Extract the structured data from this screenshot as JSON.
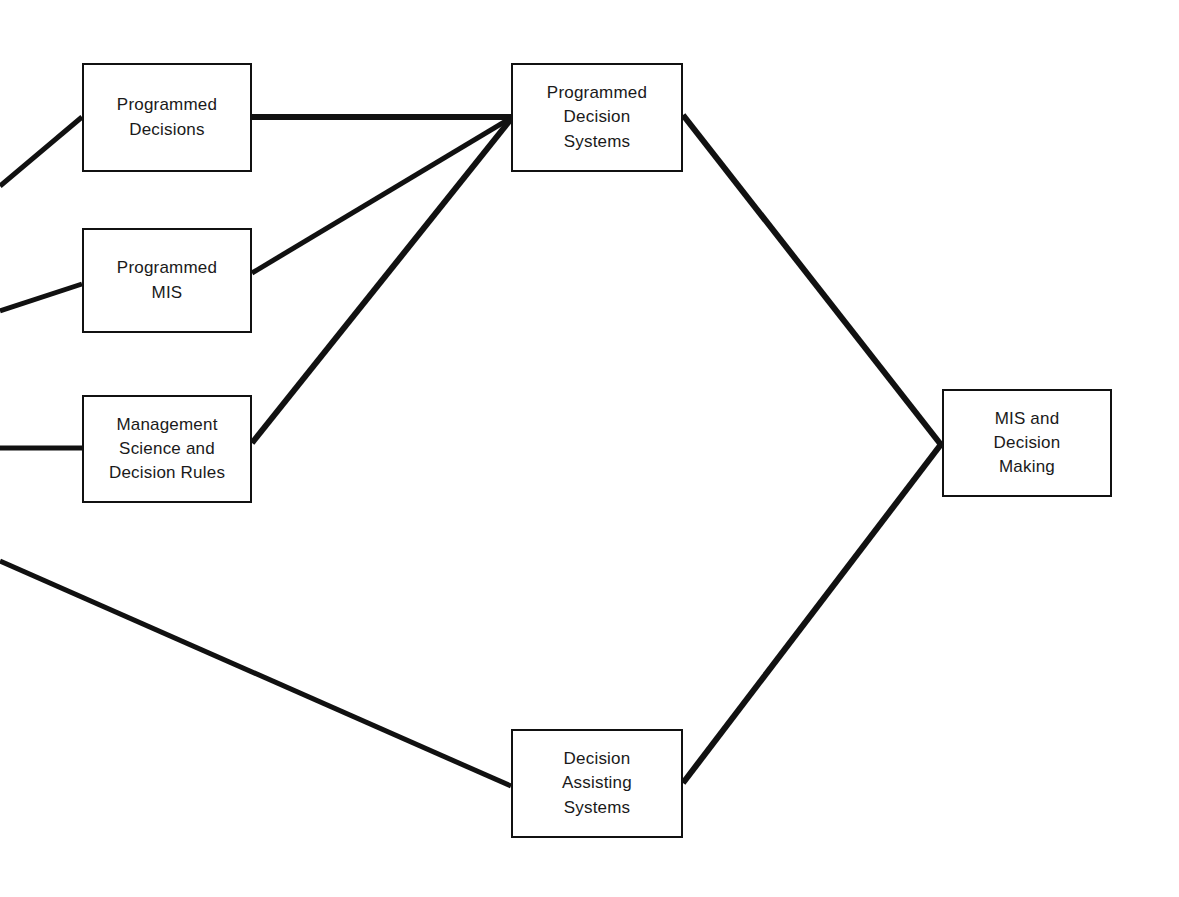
{
  "diagram": {
    "title": "MIS and Decision Making",
    "type": "flow-diagram",
    "canvas": {
      "width": 1179,
      "height": 897
    },
    "colors": {
      "background": "#ffffff",
      "box_border": "#111111",
      "connector": "#111111",
      "text": "#1a1a1a"
    },
    "nodes": [
      {
        "id": "programmed-decisions",
        "label": "Programmed\nDecisions",
        "x": 82,
        "y": 63,
        "width": 170,
        "height": 109
      },
      {
        "id": "programmed-mis",
        "label": "Programmed\nMIS",
        "x": 82,
        "y": 228,
        "width": 170,
        "height": 105
      },
      {
        "id": "management-science-and-decision-rules",
        "label": "Management\nScience and\nDecision Rules",
        "x": 82,
        "y": 395,
        "width": 170,
        "height": 108
      },
      {
        "id": "programmed-decision-systems",
        "label": "Programmed\nDecision\nSystems",
        "x": 511,
        "y": 63,
        "width": 172,
        "height": 109
      },
      {
        "id": "decision-assisting-systems",
        "label": "Decision\nAssisting\nSystems",
        "x": 511,
        "y": 729,
        "width": 172,
        "height": 109
      },
      {
        "id": "mis-and-decision-making",
        "label": "MIS and\nDecision\nMaking",
        "x": 942,
        "y": 389,
        "width": 170,
        "height": 108
      }
    ],
    "connectors": [
      {
        "id": "offscreen-to-programmed-decisions",
        "from": "left-edge",
        "to": "programmed-decisions",
        "x1": 0,
        "y1": 186,
        "x2": 82,
        "y2": 117,
        "width": 5
      },
      {
        "id": "offscreen-to-programmed-mis",
        "from": "left-edge",
        "to": "programmed-mis",
        "x1": 0,
        "y1": 311,
        "x2": 82,
        "y2": 284,
        "width": 5
      },
      {
        "id": "offscreen-to-management-science",
        "from": "left-edge",
        "to": "management-science-and-decision-rules",
        "x1": 0,
        "y1": 448,
        "x2": 82,
        "y2": 448,
        "width": 5
      },
      {
        "id": "offscreen-to-decision-assisting-systems",
        "from": "left-edge",
        "to": "decision-assisting-systems",
        "x1": 0,
        "y1": 561,
        "x2": 511,
        "y2": 786,
        "width": 5
      },
      {
        "id": "programmed-decisions-to-programmed-decision-systems",
        "from": "programmed-decisions",
        "to": "programmed-decision-systems",
        "x1": 252,
        "y1": 117,
        "x2": 511,
        "y2": 117,
        "width": 6
      },
      {
        "id": "programmed-mis-to-programmed-decision-systems",
        "from": "programmed-mis",
        "to": "programmed-decision-systems",
        "x1": 252,
        "y1": 273,
        "x2": 511,
        "y2": 118,
        "width": 5
      },
      {
        "id": "management-science-to-programmed-decision-systems",
        "from": "management-science-and-decision-rules",
        "to": "programmed-decision-systems",
        "x1": 252,
        "y1": 443,
        "x2": 511,
        "y2": 119,
        "width": 6
      },
      {
        "id": "programmed-decision-systems-to-mis-and-decision-making",
        "from": "programmed-decision-systems",
        "to": "mis-and-decision-making",
        "x1": 683,
        "y1": 115,
        "x2": 942,
        "y2": 446,
        "width": 6
      },
      {
        "id": "decision-assisting-systems-to-mis-and-decision-making",
        "from": "decision-assisting-systems",
        "to": "mis-and-decision-making",
        "x1": 683,
        "y1": 783,
        "x2": 942,
        "y2": 443,
        "width": 6
      }
    ]
  }
}
